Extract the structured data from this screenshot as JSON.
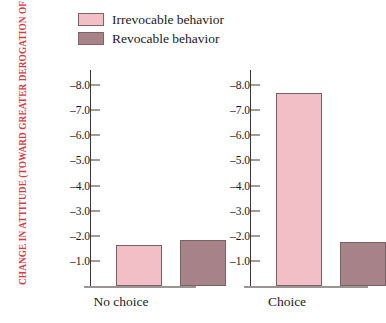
{
  "legend": {
    "items": [
      {
        "label": "Irrevocable behavior",
        "color": "#f3bfc6"
      },
      {
        "label": "Revocable behavior",
        "color": "#a78289"
      }
    ]
  },
  "axis": {
    "title": "CHANGE IN ATTITUDE (TOWARD GREATER DEROGATION OF VICTIM)",
    "title_color": "#e0383f",
    "tick_labels": [
      "–1.0",
      "–2.0",
      "–3.0",
      "–4.0",
      "–5.0",
      "–6.0",
      "–7.0",
      "–8.0"
    ]
  },
  "chart_data": {
    "type": "bar",
    "title": "",
    "xlabel": "",
    "ylabel": "CHANGE IN ATTITUDE (TOWARD GREATER DEROGATION OF VICTIM)",
    "categories": [
      "No choice",
      "Choice"
    ],
    "series": [
      {
        "name": "Irrevocable behavior",
        "color": "#f3bfc6",
        "values": [
          -1.65,
          -7.7
        ]
      },
      {
        "name": "Revocable behavior",
        "color": "#a78289",
        "values": [
          -1.85,
          -1.75
        ]
      }
    ],
    "yticks": [
      -1.0,
      -2.0,
      -3.0,
      -4.0,
      -5.0,
      -6.0,
      -7.0,
      -8.0
    ],
    "ylim": [
      0,
      -8.6
    ],
    "y_axis_inverted": true,
    "grid": false,
    "legend_position": "top-left",
    "panels": 2,
    "note": "Each category panel has its own identical y-axis"
  }
}
